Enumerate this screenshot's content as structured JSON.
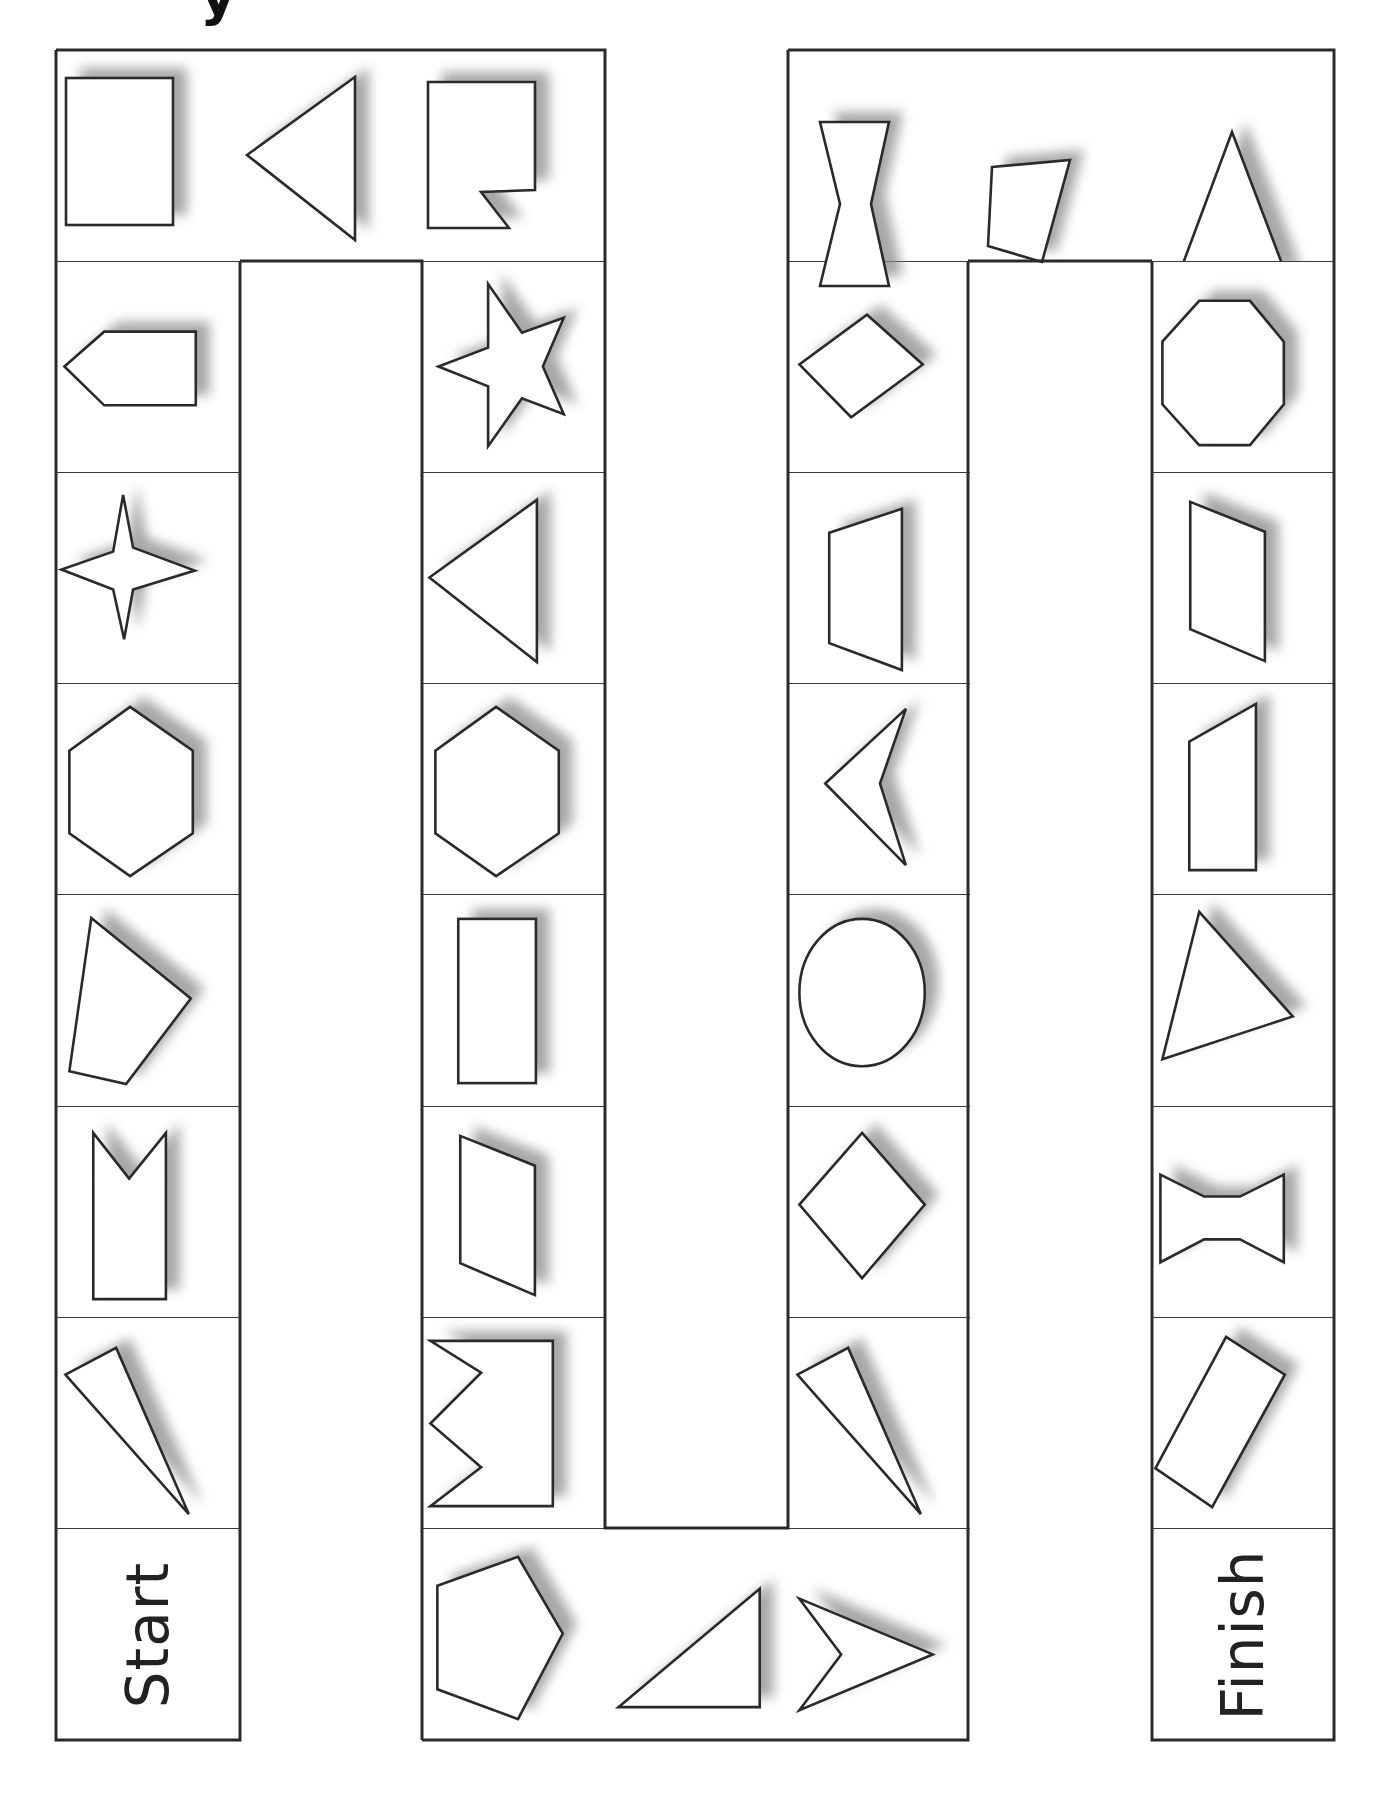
{
  "page": {
    "title_fragment": "y",
    "background": "#ffffff",
    "line_color": "#2a2a2a",
    "shadow_color": "#8a8a8a"
  },
  "board": {
    "columns_x": [
      56,
      240,
      422,
      605,
      788,
      970,
      1152,
      1334
    ],
    "rows_y": [
      50,
      261,
      472,
      683,
      894,
      1106,
      1317,
      1528,
      1740
    ],
    "start_label": "Start",
    "finish_label": "Finish"
  },
  "cells": [
    {
      "id": "c1",
      "col": 0,
      "row": 0,
      "shape": "square"
    },
    {
      "id": "c2",
      "col": 1,
      "row": 0,
      "shape": "triangle-pointing-left"
    },
    {
      "id": "c3",
      "col": 2,
      "row": 0,
      "shape": "notched-square"
    },
    {
      "id": "c4",
      "col": 0,
      "row": 1,
      "shape": "pentagon-arrow-left"
    },
    {
      "id": "c5",
      "col": 2,
      "row": 1,
      "shape": "five-point-star"
    },
    {
      "id": "c6",
      "col": 0,
      "row": 2,
      "shape": "four-point-star"
    },
    {
      "id": "c7",
      "col": 2,
      "row": 2,
      "shape": "triangle-pointing-left"
    },
    {
      "id": "c8",
      "col": 0,
      "row": 3,
      "shape": "hexagon"
    },
    {
      "id": "c9",
      "col": 2,
      "row": 3,
      "shape": "hexagon"
    },
    {
      "id": "c10",
      "col": 0,
      "row": 4,
      "shape": "irregular-quadrilateral"
    },
    {
      "id": "c11",
      "col": 2,
      "row": 4,
      "shape": "rectangle"
    },
    {
      "id": "c12",
      "col": 0,
      "row": 5,
      "shape": "notched-rectangle"
    },
    {
      "id": "c13",
      "col": 2,
      "row": 5,
      "shape": "parallelogram"
    },
    {
      "id": "c14",
      "col": 0,
      "row": 6,
      "shape": "thin-triangle"
    },
    {
      "id": "c15",
      "col": 2,
      "row": 6,
      "shape": "zigzag-square"
    },
    {
      "id": "c16",
      "col": 0,
      "row": 7,
      "shape": "start",
      "label_key": "start_label"
    },
    {
      "id": "c17",
      "col": 2,
      "row": 7,
      "shape": "pentagon"
    },
    {
      "id": "c18",
      "col": 3,
      "row": 7,
      "shape": "right-triangle"
    },
    {
      "id": "c19",
      "col": 4,
      "row": 7,
      "shape": "arrowhead-right"
    },
    {
      "id": "c20",
      "col": 4,
      "row": 6,
      "shape": "thin-triangle"
    },
    {
      "id": "c21",
      "col": 4,
      "row": 5,
      "shape": "square-diamond"
    },
    {
      "id": "c22",
      "col": 4,
      "row": 4,
      "shape": "circle"
    },
    {
      "id": "c23",
      "col": 4,
      "row": 3,
      "shape": "arrowhead-left"
    },
    {
      "id": "c24",
      "col": 4,
      "row": 2,
      "shape": "trapezoid"
    },
    {
      "id": "c25",
      "col": 4,
      "row": 1,
      "shape": "rhombus"
    },
    {
      "id": "c26",
      "col": 4,
      "row": 0,
      "shape": "hourglass"
    },
    {
      "id": "c27",
      "col": 5,
      "row": 0,
      "shape": "quadrilateral"
    },
    {
      "id": "c28",
      "col": 6,
      "row": 0,
      "shape": "isosceles-triangle"
    },
    {
      "id": "c29",
      "col": 6,
      "row": 1,
      "shape": "octagon"
    },
    {
      "id": "c30",
      "col": 6,
      "row": 2,
      "shape": "parallelogram"
    },
    {
      "id": "c31",
      "col": 6,
      "row": 3,
      "shape": "right-trapezoid"
    },
    {
      "id": "c32",
      "col": 6,
      "row": 4,
      "shape": "scalene-triangle"
    },
    {
      "id": "c33",
      "col": 6,
      "row": 5,
      "shape": "bowtie"
    },
    {
      "id": "c34",
      "col": 6,
      "row": 6,
      "shape": "rotated-rectangle"
    },
    {
      "id": "c35",
      "col": 6,
      "row": 7,
      "shape": "finish",
      "label_key": "finish_label"
    }
  ]
}
